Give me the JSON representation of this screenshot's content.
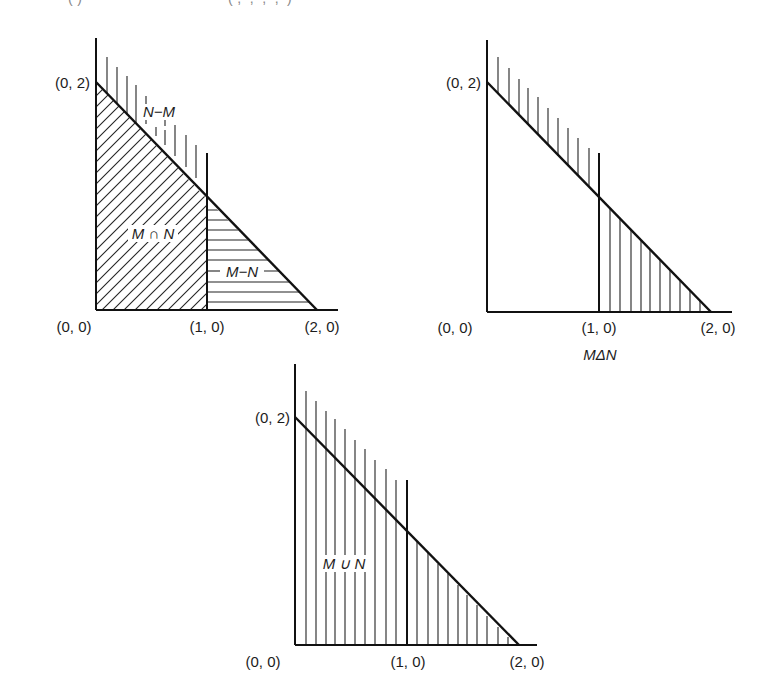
{
  "header": {
    "cut_off_text_left": "(·)",
    "cut_off_text_right": "(·, ·, ·, ·, ·)"
  },
  "diagrams": [
    {
      "id": "partition",
      "point_labels": {
        "origin": "(0, 0)",
        "y_intercept": "(0, 2)",
        "x_one": "(1, 0)",
        "x_two": "(2, 0)"
      },
      "region_labels": {
        "n_minus_m": "N−M",
        "m_intersect_n": "M ∩ N",
        "m_minus_n": "M−N"
      },
      "caption": ""
    },
    {
      "id": "symmetric-difference",
      "point_labels": {
        "origin": "(0, 0)",
        "y_intercept": "(0, 2)",
        "x_one": "(1, 0)",
        "x_two": "(2, 0)"
      },
      "caption": "MΔN"
    },
    {
      "id": "union",
      "point_labels": {
        "origin": "(0, 0)",
        "y_intercept": "(0, 2)",
        "x_one": "(1, 0)",
        "x_two": "(2, 0)"
      },
      "region_labels": {
        "m_union_n": "M ∪ N"
      },
      "caption": ""
    }
  ],
  "colors": {
    "ink": "#111111",
    "background": "#ffffff"
  }
}
